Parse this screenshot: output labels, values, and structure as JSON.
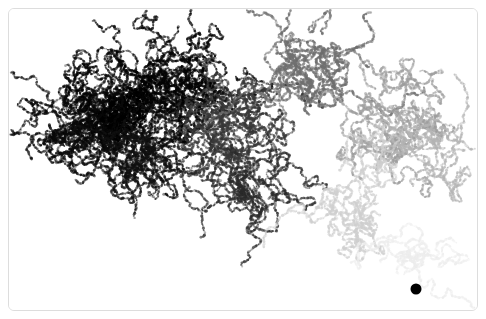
{
  "figure": {
    "title": "",
    "background_color": "#ffffff",
    "border_color": "#dddddd",
    "border_radius_px": 6,
    "border_inset_px": 8,
    "width_px": 486,
    "height_px": 319
  },
  "chart_data": {
    "type": "scatter",
    "title": "",
    "subtitle": "",
    "xlabel": "",
    "ylabel": "",
    "grid": false,
    "legend": null,
    "axes_visible": false,
    "tick_labels_x": [],
    "tick_labels_y": [],
    "xlim": [
      0,
      470
    ],
    "ylim": [
      0,
      303
    ],
    "colormap": {
      "name": "grayscale-age",
      "newest_color": "#fafafa",
      "mid_color": "#9a9a9a",
      "oldest_color": "#000000"
    },
    "seed": {
      "label": "seed-particle",
      "x": 407,
      "y": 280,
      "radius_px": 5.5,
      "color": "#000000"
    },
    "particle_count": 26000,
    "point_radius_px": 1.15,
    "random_seed": 20947,
    "branches": [
      {
        "name": "upper-left-dense-core",
        "anchor_x": 110,
        "anchor_y": 105,
        "shade": "#000000",
        "weight": 0.2
      },
      {
        "name": "left-lobe",
        "anchor_x": 70,
        "anchor_y": 120,
        "shade": "#0a0a0a",
        "weight": 0.1
      },
      {
        "name": "upper-mid-cluster",
        "anchor_x": 168,
        "anchor_y": 70,
        "shade": "#050505",
        "weight": 0.12
      },
      {
        "name": "lower-left-arm",
        "anchor_x": 130,
        "anchor_y": 150,
        "shade": "#111111",
        "weight": 0.09
      },
      {
        "name": "center-descending-arm",
        "anchor_x": 232,
        "anchor_y": 160,
        "shade": "#2b2b2b",
        "weight": 0.11
      },
      {
        "name": "center-spine",
        "anchor_x": 222,
        "anchor_y": 110,
        "shade": "#3a3a3a",
        "weight": 0.07
      },
      {
        "name": "upper-right-loop",
        "anchor_x": 300,
        "anchor_y": 55,
        "shade": "#6f6f6f",
        "weight": 0.09
      },
      {
        "name": "right-upper-mass",
        "anchor_x": 385,
        "anchor_y": 110,
        "shade": "#9e9e9e",
        "weight": 0.08
      },
      {
        "name": "right-far-arm",
        "anchor_x": 432,
        "anchor_y": 130,
        "shade": "#b4b4b4",
        "weight": 0.05
      },
      {
        "name": "right-lower-fan",
        "anchor_x": 340,
        "anchor_y": 195,
        "shade": "#cfcfcf",
        "weight": 0.06
      },
      {
        "name": "seed-halo-trail",
        "anchor_x": 400,
        "anchor_y": 250,
        "shade": "#ededed",
        "weight": 0.03
      }
    ]
  }
}
